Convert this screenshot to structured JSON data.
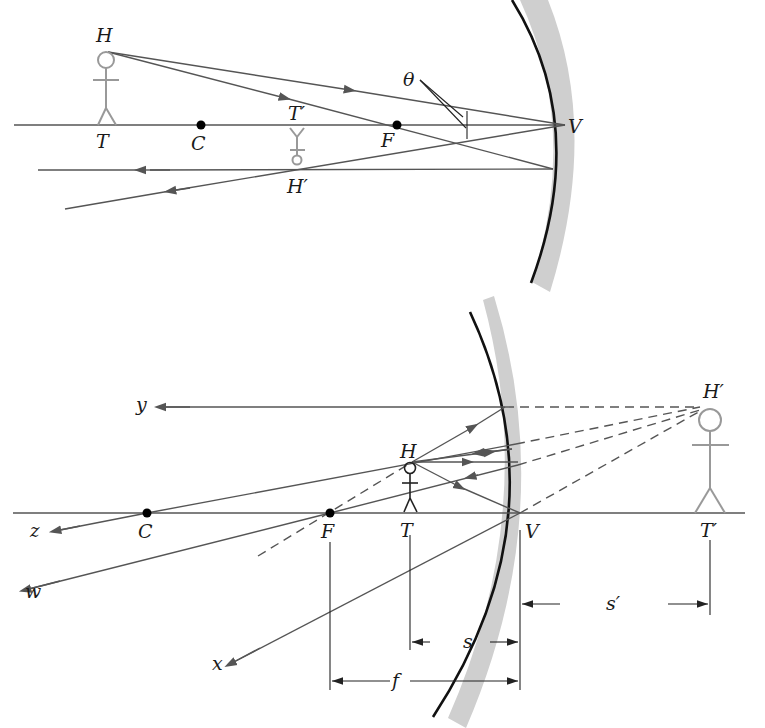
{
  "figure": {
    "colors": {
      "ray": "#555555",
      "mirror": "#111111",
      "mirror_backing": "#cfcfcf",
      "object_real": "#999999",
      "object_dark": "#222222",
      "background": "#ffffff"
    }
  },
  "top_diagram": {
    "labels": {
      "object_head": "H",
      "object_foot": "T",
      "center": "C",
      "focus": "F",
      "vertex": "V",
      "image_foot": "T′",
      "image_head": "H′",
      "angle": "θ"
    }
  },
  "bottom_diagram": {
    "labels": {
      "object_head": "H",
      "object_foot": "T",
      "center": "C",
      "focus": "F",
      "vertex": "V",
      "image_foot": "T′",
      "image_head": "H′",
      "ray_y": "y",
      "ray_z": "z",
      "ray_w": "w",
      "ray_x": "x",
      "object_distance": "s",
      "image_distance": "s′",
      "focal_length": "f"
    }
  }
}
